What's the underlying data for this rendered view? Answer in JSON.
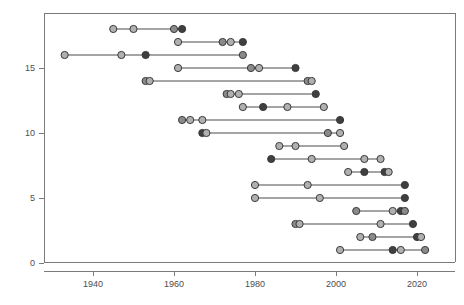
{
  "chart_data": {
    "type": "scatter",
    "title": "",
    "subtitle": "",
    "xlabel": "",
    "ylabel": "",
    "xlim": [
      1928,
      2026
    ],
    "ylim": [
      -0.6,
      18.9
    ],
    "grid": false,
    "legend": null,
    "x_ticks": [
      1940,
      1960,
      1980,
      2000,
      2020
    ],
    "x_tick_labels": [
      "1940",
      "1960",
      "1980",
      "2000",
      "2020"
    ],
    "y_ticks": [
      0,
      5,
      10,
      15
    ],
    "y_tick_labels": [
      "0",
      "5",
      "10",
      "15"
    ],
    "palette": {
      "light_marker": "#b0b0b0",
      "dark_marker": "#3f3f3f",
      "mid_marker": "#8a8a8a",
      "line": "#4a4a4a",
      "axis": "#7a7a7a",
      "label": "#4d4d4d",
      "background": "#ffffff"
    },
    "marker_radius": 3.6,
    "series": [
      {
        "name": "row-18",
        "y": 18,
        "x": [
          1945,
          1950,
          1960,
          1962
        ],
        "shades": [
          "light",
          "light",
          "mid",
          "dark"
        ]
      },
      {
        "name": "row-17",
        "y": 17,
        "x": [
          1961,
          1972,
          1974,
          1977
        ],
        "shades": [
          "light",
          "mid",
          "light",
          "dark"
        ]
      },
      {
        "name": "row-16",
        "y": 16,
        "x": [
          1933,
          1947,
          1953,
          1977
        ],
        "shades": [
          "light",
          "light",
          "dark",
          "mid"
        ]
      },
      {
        "name": "row-15",
        "y": 15,
        "x": [
          1961,
          1979,
          1981,
          1990
        ],
        "shades": [
          "light",
          "mid",
          "light",
          "dark"
        ]
      },
      {
        "name": "row-14",
        "y": 14,
        "x": [
          1953,
          1954,
          1993,
          1994
        ],
        "shades": [
          "mid",
          "light",
          "mid",
          "light"
        ]
      },
      {
        "name": "row-13",
        "y": 13,
        "x": [
          1973,
          1974,
          1976,
          1995
        ],
        "shades": [
          "mid",
          "light",
          "light",
          "dark"
        ]
      },
      {
        "name": "row-12",
        "y": 12,
        "x": [
          1977,
          1982,
          1988,
          1997
        ],
        "shades": [
          "light",
          "dark",
          "light",
          "light"
        ]
      },
      {
        "name": "row-11",
        "y": 11,
        "x": [
          1962,
          1964,
          1967,
          2001
        ],
        "shades": [
          "mid",
          "light",
          "light",
          "dark"
        ]
      },
      {
        "name": "row-10",
        "y": 10,
        "x": [
          1967,
          1968,
          1998,
          2001
        ],
        "shades": [
          "dark",
          "light",
          "mid",
          "light"
        ]
      },
      {
        "name": "row-9",
        "y": 9,
        "x": [
          1986,
          1990,
          2002
        ],
        "shades": [
          "light",
          "light",
          "light"
        ]
      },
      {
        "name": "row-8",
        "y": 8,
        "x": [
          1984,
          1994,
          2007,
          2011
        ],
        "shades": [
          "dark",
          "light",
          "light",
          "light"
        ]
      },
      {
        "name": "row-7",
        "y": 7,
        "x": [
          2003,
          2007,
          2012,
          2013
        ],
        "shades": [
          "light",
          "dark",
          "dark",
          "light"
        ]
      },
      {
        "name": "row-6",
        "y": 6,
        "x": [
          1980,
          1993,
          2017
        ],
        "shades": [
          "light",
          "light",
          "dark"
        ]
      },
      {
        "name": "row-5",
        "y": 5,
        "x": [
          1980,
          1996,
          2017
        ],
        "shades": [
          "light",
          "light",
          "dark"
        ]
      },
      {
        "name": "row-4",
        "y": 4,
        "x": [
          2005,
          2014,
          2016,
          2017
        ],
        "shades": [
          "mid",
          "light",
          "dark",
          "mid"
        ]
      },
      {
        "name": "row-3",
        "y": 3,
        "x": [
          1990,
          1991,
          2011,
          2019
        ],
        "shades": [
          "mid",
          "light",
          "light",
          "dark"
        ]
      },
      {
        "name": "row-2",
        "y": 2,
        "x": [
          2006,
          2009,
          2020,
          2021
        ],
        "shades": [
          "light",
          "mid",
          "dark",
          "light"
        ]
      },
      {
        "name": "row-1",
        "y": 1,
        "x": [
          2001,
          2014,
          2016,
          2022
        ],
        "shades": [
          "light",
          "dark",
          "light",
          "mid"
        ]
      }
    ]
  }
}
